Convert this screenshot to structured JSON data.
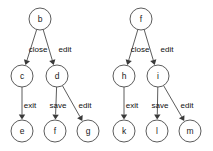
{
  "diagram": {
    "title": "",
    "type": "directed-graph",
    "background_color": "#ffffff",
    "node_stroke_color": "#4a4a4a",
    "node_fill_color": "#ffffff",
    "edge_color": "#4a4a4a",
    "label_color": "#101010",
    "node_radius": 11,
    "graphs": [
      {
        "name": "left-tree",
        "root": "b",
        "nodes": [
          {
            "id": "b",
            "label": "b",
            "cx": 40,
            "cy": 19
          },
          {
            "id": "c",
            "label": "c",
            "cx": 22,
            "cy": 76
          },
          {
            "id": "d",
            "label": "d",
            "cx": 57,
            "cy": 76
          },
          {
            "id": "e",
            "label": "e",
            "cx": 22,
            "cy": 131
          },
          {
            "id": "f",
            "label": "f",
            "cx": 55,
            "cy": 131
          },
          {
            "id": "g",
            "label": "g",
            "cx": 88,
            "cy": 131
          }
        ],
        "edges": [
          {
            "from": "b",
            "to": "c",
            "label": "close",
            "label_x": 38,
            "label_y": 50
          },
          {
            "from": "b",
            "to": "d",
            "label": "edit",
            "label_x": 65,
            "label_y": 50
          },
          {
            "from": "c",
            "to": "e",
            "label": "exit",
            "label_x": 30,
            "label_y": 106
          },
          {
            "from": "d",
            "to": "f",
            "label": "save",
            "label_x": 58,
            "label_y": 106
          },
          {
            "from": "d",
            "to": "g",
            "label": "edit",
            "label_x": 85,
            "label_y": 106
          }
        ]
      },
      {
        "name": "right-tree",
        "root": "f",
        "nodes": [
          {
            "id": "f2",
            "label": "f",
            "cx": 141,
            "cy": 19
          },
          {
            "id": "h",
            "label": "h",
            "cx": 124,
            "cy": 76
          },
          {
            "id": "i",
            "label": "i",
            "cx": 158,
            "cy": 76
          },
          {
            "id": "k",
            "label": "k",
            "cx": 124,
            "cy": 131
          },
          {
            "id": "l",
            "label": "l",
            "cx": 157,
            "cy": 131
          },
          {
            "id": "m",
            "label": "m",
            "cx": 190,
            "cy": 131
          }
        ],
        "edges": [
          {
            "from": "f2",
            "to": "h",
            "label": "close",
            "label_x": 140,
            "label_y": 50
          },
          {
            "from": "f2",
            "to": "i",
            "label": "edit",
            "label_x": 167,
            "label_y": 50
          },
          {
            "from": "h",
            "to": "k",
            "label": "exit",
            "label_x": 132,
            "label_y": 106
          },
          {
            "from": "i",
            "to": "l",
            "label": "save",
            "label_x": 160,
            "label_y": 106
          },
          {
            "from": "i",
            "to": "m",
            "label": "edit",
            "label_x": 187,
            "label_y": 106
          }
        ]
      }
    ]
  }
}
